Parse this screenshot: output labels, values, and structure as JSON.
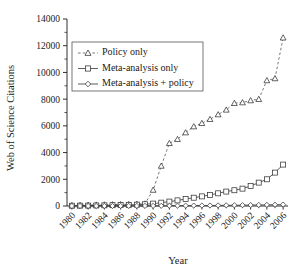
{
  "chart_data": {
    "type": "line",
    "title": "",
    "xlabel": "Year",
    "ylabel": "Web of Science Citations",
    "xlim": [
      1979.4,
      2006.6
    ],
    "ylim": [
      0,
      14000
    ],
    "grid": false,
    "legend_position": "upper-left",
    "ytick_labels": [
      "0",
      "2000",
      "4000",
      "6000",
      "8000",
      "10000",
      "12000",
      "14000"
    ],
    "ytick_values": [
      0,
      2000,
      4000,
      6000,
      8000,
      10000,
      12000,
      14000
    ],
    "yminor_step": 1000,
    "xtick_labels": [
      "1980",
      "1982",
      "1984",
      "1986",
      "1988",
      "1990",
      "1992",
      "1994",
      "1996",
      "1998",
      "2000",
      "2002",
      "2004",
      "2006"
    ],
    "xtick_values": [
      1980,
      1982,
      1984,
      1986,
      1988,
      1990,
      1992,
      1994,
      1996,
      1998,
      2000,
      2002,
      2004,
      2006
    ],
    "x": [
      1980,
      1981,
      1982,
      1983,
      1984,
      1985,
      1986,
      1987,
      1988,
      1989,
      1990,
      1991,
      1992,
      1993,
      1994,
      1995,
      1996,
      1997,
      1998,
      1999,
      2000,
      2001,
      2002,
      2003,
      2004,
      2005,
      2006
    ],
    "series": [
      {
        "name": "Policy only",
        "marker": "triangle",
        "linestyle": "dashed",
        "color": "#555555",
        "values": [
          60,
          70,
          80,
          90,
          100,
          110,
          120,
          130,
          150,
          170,
          1200,
          3000,
          4700,
          5000,
          5500,
          5950,
          6200,
          6500,
          6850,
          7200,
          7700,
          7750,
          7900,
          8000,
          9400,
          9550,
          11100
        ]
      },
      {
        "name": "Meta-analysis only",
        "marker": "square",
        "linestyle": "solid",
        "color": "#333333",
        "values": [
          20,
          25,
          30,
          40,
          50,
          60,
          70,
          85,
          100,
          130,
          180,
          250,
          330,
          420,
          520,
          620,
          720,
          830,
          950,
          1080,
          1180,
          1300,
          1500,
          1750,
          2000,
          2500,
          3100
        ]
      },
      {
        "name": "Meta-analysis + policy",
        "marker": "diamond",
        "linestyle": "solid",
        "color": "#333333",
        "values": [
          2,
          2,
          3,
          3,
          4,
          4,
          5,
          6,
          7,
          8,
          10,
          14,
          18,
          22,
          26,
          30,
          34,
          38,
          44,
          50,
          56,
          62,
          70,
          78,
          86,
          95,
          105
        ]
      }
    ],
    "last_point_policy": 12600,
    "note_final_policy_2006": 12600
  },
  "legend": {
    "items": [
      {
        "label": "Policy only"
      },
      {
        "label": "Meta-analysis only"
      },
      {
        "label": "Meta-analysis + policy"
      }
    ]
  },
  "axes": {
    "x_title": "Year",
    "y_title": "Web of Science Citations"
  }
}
